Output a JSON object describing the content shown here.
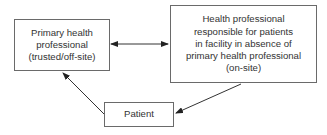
{
  "nodes": {
    "primary": {
      "lines": [
        "Primary health",
        "professional",
        "(trusted/off-site)"
      ]
    },
    "onsite": {
      "lines": [
        "Health professional",
        "responsible for patients",
        "in facility in absence of",
        "primary health professional",
        "(on-site)"
      ]
    },
    "patient": {
      "lines": [
        "Patient"
      ]
    }
  },
  "edges": [
    {
      "from": "primary",
      "to": "onsite",
      "direction": "bidirectional"
    },
    {
      "from": "onsite",
      "to": "patient",
      "direction": "forward"
    },
    {
      "from": "patient",
      "to": "primary",
      "direction": "forward"
    }
  ],
  "colors": {
    "line": "#333333",
    "border": "#6a6a6a",
    "text": "#333333"
  }
}
